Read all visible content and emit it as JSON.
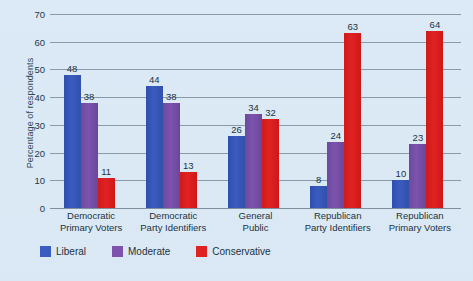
{
  "chart_data": {
    "type": "bar",
    "title": "",
    "xlabel": "",
    "ylabel": "Percentage of respondents",
    "ylim": [
      0,
      70
    ],
    "ytick_step": 10,
    "yticks": [
      0,
      10,
      20,
      30,
      40,
      50,
      60,
      70
    ],
    "grid": true,
    "legend_position": "bottom-left",
    "categories": [
      "Democratic Primary Voters",
      "Democratic Party Identifiers",
      "General Public",
      "Republican Party Identifiers",
      "Republican Primary Voters"
    ],
    "category_lines": [
      [
        "Democratic",
        "Primary Voters"
      ],
      [
        "Democratic",
        "Party Identifiers"
      ],
      [
        "General",
        "Public"
      ],
      [
        "Republican",
        "Party Identifiers"
      ],
      [
        "Republican",
        "Primary Voters"
      ]
    ],
    "series": [
      {
        "name": "Liberal",
        "color": "#3a5cc0",
        "values": [
          48,
          44,
          26,
          8,
          10
        ]
      },
      {
        "name": "Moderate",
        "color": "#7d53ad",
        "values": [
          38,
          38,
          34,
          24,
          23
        ]
      },
      {
        "name": "Conservative",
        "color": "#e02222",
        "values": [
          11,
          13,
          32,
          63,
          64
        ]
      }
    ]
  },
  "colors": {
    "background": "#dceaf6",
    "gridline": "#8a9aa8",
    "text": "#1b3342",
    "liberal": "#3a5cc0",
    "moderate": "#7d53ad",
    "conservative": "#e02222"
  }
}
